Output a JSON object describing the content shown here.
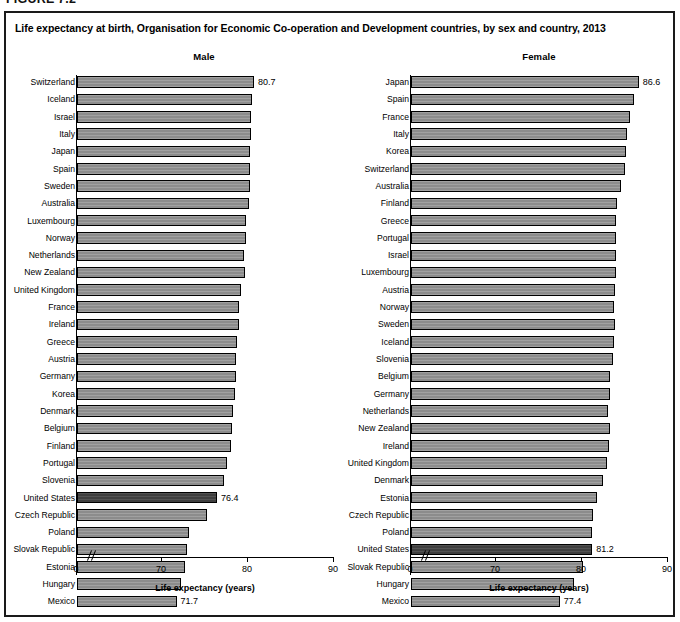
{
  "figure": {
    "number_label": "FIGURE 7.2",
    "title": "Life expectancy at birth, Organisation for Economic Co-operation and Development countries, by sex and country, 2013"
  },
  "axis": {
    "title": "Life expectancy (years)",
    "ticks": [
      "0",
      "70",
      "80",
      "90"
    ],
    "tick_values": [
      0,
      70,
      80,
      90
    ],
    "break_after_zero": true
  },
  "panels": [
    {
      "id": "male",
      "heading": "Male"
    },
    {
      "id": "female",
      "heading": "Female"
    }
  ],
  "highlight_country": "United States",
  "colors": {
    "bar_fill": "#8c8c8c",
    "bar_highlight_fill": "#3f3f3f",
    "bar_stroke": "#000000",
    "frame": "#1a1a1a",
    "text": "#000000"
  },
  "chart_data": [
    {
      "type": "bar",
      "id": "male",
      "title": "Male",
      "orientation": "horizontal",
      "xlabel": "Life expectancy (years)",
      "ylabel": "",
      "xlim": [
        68,
        90
      ],
      "xticks": [
        0,
        70,
        80,
        90
      ],
      "axis_break": "between 0 and 70",
      "grid": false,
      "legend": false,
      "labeled_points": [
        {
          "category": "Switzerland",
          "value": 80.7
        },
        {
          "category": "United States",
          "value": 76.4
        },
        {
          "category": "Mexico",
          "value": 71.7
        }
      ],
      "highlighted": [
        "United States"
      ],
      "categories": [
        "Switzerland",
        "Iceland",
        "Israel",
        "Italy",
        "Japan",
        "Spain",
        "Sweden",
        "Australia",
        "Luxembourg",
        "Norway",
        "Netherlands",
        "New Zealand",
        "United Kingdom",
        "France",
        "Ireland",
        "Greece",
        "Austria",
        "Germany",
        "Korea",
        "Denmark",
        "Belgium",
        "Finland",
        "Portugal",
        "Slovenia",
        "United States",
        "Czech Republic",
        "Poland",
        "Slovak Republic",
        "Estonia",
        "Hungary",
        "Mexico"
      ],
      "values": [
        80.7,
        80.5,
        80.3,
        80.3,
        80.2,
        80.2,
        80.2,
        80.1,
        79.8,
        79.8,
        79.5,
        79.7,
        79.2,
        79.0,
        79.0,
        78.7,
        78.6,
        78.6,
        78.5,
        78.3,
        78.1,
        78.0,
        77.6,
        77.2,
        76.4,
        75.2,
        73.1,
        72.9,
        72.7,
        72.2,
        71.7
      ],
      "value_label_unit": "years"
    },
    {
      "type": "bar",
      "id": "female",
      "title": "Female",
      "orientation": "horizontal",
      "xlabel": "Life expectancy (years)",
      "ylabel": "",
      "xlim": [
        68,
        90
      ],
      "xticks": [
        0,
        70,
        80,
        90
      ],
      "axis_break": "between 0 and 70",
      "grid": false,
      "legend": false,
      "labeled_points": [
        {
          "category": "Japan",
          "value": 86.6
        },
        {
          "category": "United States",
          "value": 81.2
        },
        {
          "category": "Mexico",
          "value": 77.4
        }
      ],
      "highlighted": [
        "United States"
      ],
      "categories": [
        "Japan",
        "Spain",
        "France",
        "Italy",
        "Korea",
        "Switzerland",
        "Australia",
        "Finland",
        "Greece",
        "Portugal",
        "Israel",
        "Luxembourg",
        "Austria",
        "Norway",
        "Sweden",
        "Iceland",
        "Slovenia",
        "Belgium",
        "Germany",
        "Netherlands",
        "New Zealand",
        "Ireland",
        "United Kingdom",
        "Denmark",
        "Estonia",
        "Czech Republic",
        "Poland",
        "United States",
        "Slovak Republic",
        "Hungary",
        "Mexico"
      ],
      "values": [
        86.6,
        86.1,
        85.6,
        85.2,
        85.1,
        85.0,
        84.5,
        84.1,
        84.0,
        84.0,
        84.0,
        83.9,
        83.8,
        83.7,
        83.8,
        83.7,
        83.6,
        83.2,
        83.2,
        83.0,
        83.2,
        83.1,
        82.9,
        82.4,
        81.7,
        81.3,
        81.2,
        81.2,
        80.1,
        79.1,
        77.4
      ],
      "value_label_unit": "years"
    }
  ]
}
